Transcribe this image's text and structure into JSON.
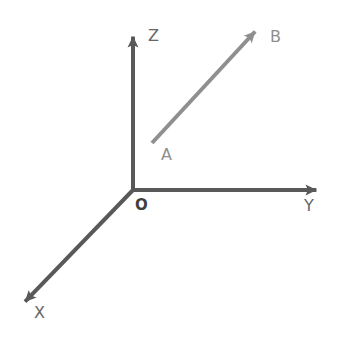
{
  "canvas": {
    "width": 347,
    "height": 337,
    "background": "#ffffff"
  },
  "figure": {
    "type": "3d-axes-vector-diagram"
  },
  "colors": {
    "axis_stroke": "#595959",
    "vector_stroke": "#8f8f8f",
    "axis_label_fill": "#666666",
    "point_label_fill": "#8f8f8f",
    "origin_label_fill": "#3f3f3f"
  },
  "geometry": {
    "origin": {
      "x": 133,
      "y": 190
    },
    "axis_stroke_width": 4,
    "vector_stroke_width": 4
  },
  "axes": [
    {
      "id": "z",
      "label": "Z",
      "from": {
        "x": 133,
        "y": 190
      },
      "to": {
        "x": 133,
        "y": 25
      },
      "label_pos": {
        "x": 148,
        "y": 36
      },
      "arrow": "z-axis-arrowhead"
    },
    {
      "id": "y",
      "label": "Y",
      "from": {
        "x": 133,
        "y": 190
      },
      "to": {
        "x": 328,
        "y": 190
      },
      "label_pos": {
        "x": 304,
        "y": 206
      },
      "arrow": "y-axis-arrowhead"
    },
    {
      "id": "x",
      "label": "X",
      "from": {
        "x": 133,
        "y": 190
      },
      "to": {
        "x": 17,
        "y": 310
      },
      "label_pos": {
        "x": 34,
        "y": 313
      },
      "arrow": "x-axis-arrowhead"
    }
  ],
  "origin_point": {
    "label": "O",
    "label_pos": {
      "x": 135,
      "y": 205
    }
  },
  "vector": {
    "id": "ab",
    "from_label": "A",
    "to_label": "B",
    "from": {
      "x": 152,
      "y": 143
    },
    "to": {
      "x": 263,
      "y": 23
    },
    "from_label_pos": {
      "x": 161,
      "y": 155
    },
    "to_label_pos": {
      "x": 270,
      "y": 37
    },
    "arrow": "vector-ab-arrowhead"
  }
}
